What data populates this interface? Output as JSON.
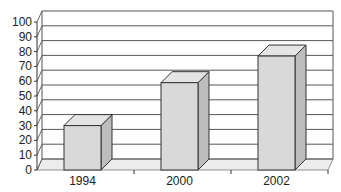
{
  "chart_data": {
    "type": "bar",
    "style": "3d-column",
    "title": "",
    "xlabel": "",
    "ylabel": "",
    "categories": [
      "1994",
      "2000",
      "2002"
    ],
    "values": [
      30,
      59,
      77
    ],
    "ylim": [
      0,
      100
    ],
    "yticks": [
      0,
      10,
      20,
      30,
      40,
      50,
      60,
      70,
      80,
      90,
      100
    ],
    "grid": true,
    "legend": null,
    "colors": {
      "bar_front": "#d9d9d9",
      "bar_top": "#e4e4e4",
      "bar_side": "#bdbdbd",
      "floor": "#ececec",
      "gridline": "#555555",
      "outline": "#333333"
    }
  }
}
